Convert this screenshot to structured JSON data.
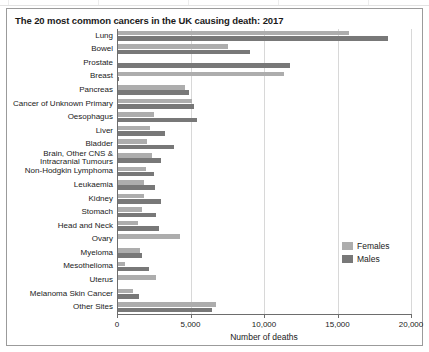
{
  "figure": {
    "title": "The 20 most common cancers in the UK causing death: 2017"
  },
  "legend": {
    "position": "right-middle",
    "items": [
      {
        "label": "Females",
        "color": "#adadad",
        "icon": "legend-swatch-females"
      },
      {
        "label": "Males",
        "color": "#787878",
        "icon": "legend-swatch-males"
      }
    ]
  },
  "axis": {
    "xlabel": "Number of deaths",
    "ticks": [
      "0",
      "5,000",
      "10,000",
      "15,000",
      "20,000"
    ]
  },
  "chart_data": {
    "type": "bar",
    "orientation": "horizontal",
    "title": "The 20 most common cancers in the UK causing death: 2017",
    "xlabel": "Number of deaths",
    "ylabel": "",
    "xlim": [
      0,
      20000
    ],
    "xticks": [
      0,
      5000,
      10000,
      15000,
      20000
    ],
    "xticklabels": [
      "0",
      "5,000",
      "10,000",
      "15,000",
      "20,000"
    ],
    "grid": "vertical",
    "legend_position": "right",
    "categories": [
      "Lung",
      "Bowel",
      "Prostate",
      "Breast",
      "Pancreas",
      "Cancer of Unknown Primary",
      "Oesophagus",
      "Liver",
      "Bladder",
      "Brain, Other CNS & Intracranial Tumours",
      "Non-Hodgkin Lymphoma",
      "Leukaemia",
      "Kidney",
      "Stomach",
      "Head and Neck",
      "Ovary",
      "Myeloma",
      "Mesothelioma",
      "Uterus",
      "Melanoma Skin Cancer",
      "Other Sites"
    ],
    "category_lines": [
      [
        "Lung"
      ],
      [
        "Bowel"
      ],
      [
        "Prostate"
      ],
      [
        "Breast"
      ],
      [
        "Pancreas"
      ],
      [
        "Cancer of Unknown Primary"
      ],
      [
        "Oesophagus"
      ],
      [
        "Liver"
      ],
      [
        "Bladder"
      ],
      [
        "Brain, Other CNS &",
        "Intracranial Tumours"
      ],
      [
        "Non-Hodgkin Lymphoma"
      ],
      [
        "Leukaemia"
      ],
      [
        "Kidney"
      ],
      [
        "Stomach"
      ],
      [
        "Head and Neck"
      ],
      [
        "Ovary"
      ],
      [
        "Myeloma"
      ],
      [
        "Mesothelioma"
      ],
      [
        "Uterus"
      ],
      [
        "Melanoma Skin Cancer"
      ],
      [
        "Other Sites"
      ]
    ],
    "series": [
      {
        "name": "Females",
        "color": "#adadad",
        "values": [
          15700,
          7500,
          0,
          11300,
          4550,
          5000,
          2450,
          2200,
          1950,
          2300,
          1900,
          1800,
          1750,
          1600,
          1350,
          4200,
          1500,
          450,
          2600,
          1000,
          6700
        ]
      },
      {
        "name": "Males",
        "color": "#787878",
        "values": [
          18400,
          9000,
          11700,
          80,
          4800,
          5150,
          5400,
          3200,
          3800,
          2900,
          2450,
          2500,
          2900,
          2600,
          2800,
          0,
          1650,
          2100,
          0,
          1400,
          6400
        ]
      }
    ]
  }
}
